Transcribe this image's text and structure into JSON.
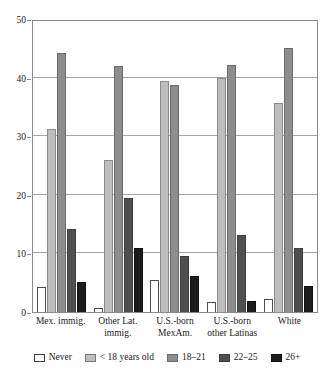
{
  "chart_data": {
    "type": "bar",
    "title": "",
    "subtitle": "",
    "xlabel": "",
    "ylabel": "",
    "ylim": [
      0,
      50
    ],
    "yticks": [
      0,
      10,
      20,
      30,
      40,
      50
    ],
    "grid": true,
    "legend_position": "bottom",
    "categories": [
      "Mex. immig.",
      "Other Lat. immig.",
      "U.S.-born MexAm.",
      "U.S.-born other Latinas",
      "White"
    ],
    "category_lines": [
      [
        "Mex. immig."
      ],
      [
        "Other Lat.",
        "immig."
      ],
      [
        "U.S.-born",
        "MexAm."
      ],
      [
        "U.S.-born",
        "other Latinas"
      ],
      [
        "White"
      ]
    ],
    "series": [
      {
        "name": "Never",
        "color": "#ffffff",
        "values": [
          4.2,
          0.6,
          5.5,
          1.7,
          2.3
        ]
      },
      {
        "name": "< 18 years old",
        "color": "#bdbdbd",
        "values": [
          31.3,
          25.9,
          39.5,
          40.0,
          35.7
        ]
      },
      {
        "name": "18–21",
        "color": "#8d8d8d",
        "values": [
          44.2,
          42.0,
          38.7,
          42.1,
          45.0
        ]
      },
      {
        "name": "22–25",
        "color": "#4f4f4f",
        "values": [
          14.2,
          19.4,
          9.5,
          13.2,
          11.0
        ]
      },
      {
        "name": "26+",
        "color": "#1c1c1c",
        "values": [
          5.2,
          11.0,
          6.2,
          1.8,
          4.4
        ]
      }
    ]
  }
}
